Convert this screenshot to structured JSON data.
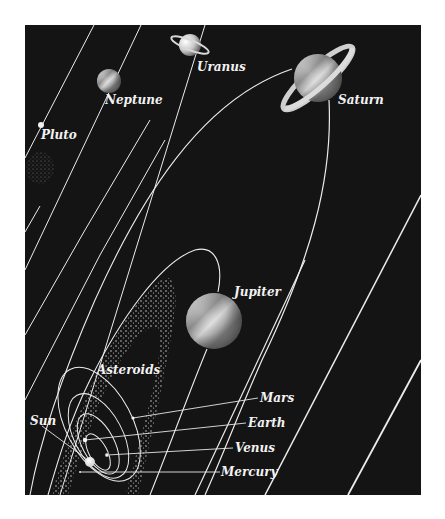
{
  "diagram": {
    "type": "solar-system-orbits",
    "background_color": "#141414",
    "orbit_color": "#eeeeee",
    "bodies": [
      {
        "name": "Sun",
        "label": "Sun"
      },
      {
        "name": "Mercury",
        "label": "Mercury"
      },
      {
        "name": "Venus",
        "label": "Venus"
      },
      {
        "name": "Earth",
        "label": "Earth"
      },
      {
        "name": "Mars",
        "label": "Mars"
      },
      {
        "name": "Asteroids",
        "label": "Asteroids"
      },
      {
        "name": "Jupiter",
        "label": "Jupiter"
      },
      {
        "name": "Saturn",
        "label": "Saturn"
      },
      {
        "name": "Uranus",
        "label": "Uranus"
      },
      {
        "name": "Neptune",
        "label": "Neptune"
      },
      {
        "name": "Pluto",
        "label": "Pluto"
      }
    ]
  },
  "labels": {
    "sun": "Sun",
    "mercury": "Mercury",
    "venus": "Venus",
    "earth": "Earth",
    "mars": "Mars",
    "asteroids": "Asteroids",
    "jupiter": "Jupiter",
    "saturn": "Saturn",
    "uranus": "Uranus",
    "neptune": "Neptune",
    "pluto": "Pluto"
  }
}
